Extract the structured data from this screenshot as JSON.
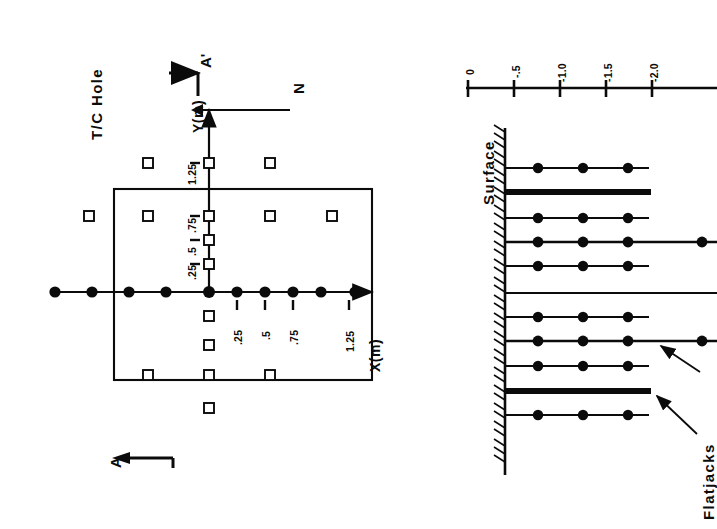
{
  "figure": {
    "orientation": "rotated-90-ccw",
    "panels": [
      "plan-view",
      "cross-section"
    ]
  },
  "plan": {
    "title": "T/C Hole",
    "x_axis_label": "X(m)",
    "y_axis_label": "Y(m)",
    "x_ticks": [
      ".25",
      ".5",
      ".75",
      "1.25"
    ],
    "y_ticks": [
      ".25",
      ".5",
      ".75",
      "1.25"
    ],
    "north_label": "N",
    "section_start_label": "A",
    "section_end_label": "A'",
    "block_outline": "rectangle",
    "marker_legend": {
      "filled_circle": "T/C Hole",
      "open_square": "instrument hole"
    },
    "x_axis_points_m": [
      -1.25,
      -0.9,
      -0.55,
      -0.25,
      0,
      0.25,
      0.5,
      0.75,
      1.0,
      1.25
    ],
    "y_axis_points_m": [
      0.25,
      0.5,
      0.75,
      1.25
    ],
    "open_square_grid_m": [
      {
        "x": -1.25,
        "y": 1.25
      },
      {
        "x": -1.25,
        "y": 0.75
      },
      {
        "x": -1.25,
        "y": -0.75
      },
      {
        "x": -0.55,
        "y": 0.75
      },
      {
        "x": 0.0,
        "y": 1.25
      },
      {
        "x": 0.0,
        "y": 0.75
      },
      {
        "x": 0.0,
        "y": 0.5
      },
      {
        "x": 0.0,
        "y": 0.25
      },
      {
        "x": 0.0,
        "y": -0.25
      },
      {
        "x": 0.0,
        "y": -0.5
      },
      {
        "x": 0.0,
        "y": -0.75
      },
      {
        "x": 0.0,
        "y": -1.3
      },
      {
        "x": 0.75,
        "y": 1.25
      },
      {
        "x": 0.75,
        "y": 0.75
      },
      {
        "x": 0.75,
        "y": -0.75
      },
      {
        "x": 1.25,
        "y": 0.75
      }
    ]
  },
  "section": {
    "surface_label": "Surface",
    "flatjacks_label": "Flatjacks",
    "depth_axis_ticks": [
      "0",
      "-.5",
      "-1.0",
      "-1.5",
      "-2.0"
    ],
    "depth_axis_values": [
      0,
      -0.5,
      -1.0,
      -1.5,
      -2.0
    ],
    "hole_rows": [
      {
        "index": 1,
        "type": "instrumented",
        "points": 3,
        "length": "short"
      },
      {
        "index": 2,
        "type": "flatjack",
        "points": 0,
        "length": "medium"
      },
      {
        "index": 3,
        "type": "instrumented",
        "points": 3,
        "length": "short"
      },
      {
        "index": 4,
        "type": "instrumented",
        "points": 4,
        "length": "long"
      },
      {
        "index": 5,
        "type": "instrumented",
        "points": 3,
        "length": "short"
      },
      {
        "index": 6,
        "type": "plain",
        "points": 0,
        "length": "long"
      },
      {
        "index": 7,
        "type": "instrumented",
        "points": 3,
        "length": "short"
      },
      {
        "index": 8,
        "type": "instrumented",
        "points": 4,
        "length": "long"
      },
      {
        "index": 9,
        "type": "instrumented",
        "points": 3,
        "length": "short"
      },
      {
        "index": 10,
        "type": "flatjack",
        "points": 0,
        "length": "medium"
      },
      {
        "index": 11,
        "type": "instrumented",
        "points": 3,
        "length": "short"
      }
    ]
  },
  "colors": {
    "ink": "#0b0b0b",
    "background": "#ffffff"
  }
}
